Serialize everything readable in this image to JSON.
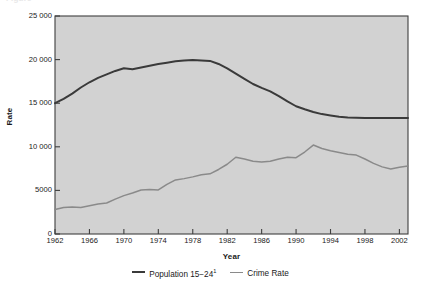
{
  "figure": {
    "clipped_title": "Figure",
    "ylabel": "Rate",
    "xlabel": "Year",
    "plot_bg": "#d2d2d2",
    "frame_color": "#3f3f3f"
  },
  "legend": {
    "position": "bottom-center",
    "entries": [
      {
        "label": "Population 15−24",
        "superscript": "1",
        "color": "#3a3a3a",
        "name": "population-15-24"
      },
      {
        "label": "Crime Rate",
        "superscript": "",
        "color": "#8a8a8a",
        "name": "crime-rate"
      }
    ]
  },
  "chart_data": {
    "type": "line",
    "title": "",
    "xlabel": "Year",
    "ylabel": "Rate",
    "xlim": [
      1962,
      2003
    ],
    "ylim": [
      0,
      25000
    ],
    "grid": false,
    "legend_position": "bottom-center",
    "xticks": [
      1962,
      1966,
      1970,
      1974,
      1978,
      1982,
      1986,
      1990,
      1994,
      1998,
      2002
    ],
    "xtick_labels": [
      "1962",
      "1966",
      "1970",
      "1974",
      "1978",
      "1982",
      "1986",
      "1990",
      "1994",
      "1998",
      "2002"
    ],
    "yticks": [
      0,
      5000,
      10000,
      15000,
      20000,
      25000
    ],
    "ytick_labels": [
      "0",
      "5000",
      "10 000",
      "15 000",
      "20 000",
      "25 000"
    ],
    "x": [
      1962,
      1963,
      1964,
      1965,
      1966,
      1967,
      1968,
      1969,
      1970,
      1971,
      1972,
      1973,
      1974,
      1975,
      1976,
      1977,
      1978,
      1979,
      1980,
      1981,
      1982,
      1983,
      1984,
      1985,
      1986,
      1987,
      1988,
      1989,
      1990,
      1991,
      1992,
      1993,
      1994,
      1995,
      1996,
      1997,
      1998,
      1999,
      2000,
      2001,
      2002,
      2003
    ],
    "series": [
      {
        "name": "Population 15−24",
        "color": "#3a3a3a",
        "linewidth": 2.0,
        "values": [
          15000,
          15500,
          16100,
          16800,
          17400,
          17900,
          18300,
          18700,
          19000,
          18900,
          19100,
          19300,
          19500,
          19650,
          19800,
          19900,
          19950,
          19900,
          19850,
          19500,
          19000,
          18400,
          17800,
          17200,
          16750,
          16350,
          15800,
          15200,
          14650,
          14300,
          14000,
          13750,
          13600,
          13450,
          13350,
          13320,
          13300,
          13300,
          13300,
          13300,
          13300,
          13300
        ]
      },
      {
        "name": "Crime Rate",
        "color": "#8a8a8a",
        "linewidth": 1.5,
        "values": [
          2800,
          3050,
          3100,
          3050,
          3250,
          3450,
          3550,
          4000,
          4400,
          4700,
          5050,
          5100,
          5050,
          5700,
          6200,
          6350,
          6550,
          6800,
          6900,
          7400,
          8000,
          8800,
          8600,
          8350,
          8250,
          8350,
          8600,
          8800,
          8750,
          9400,
          10200,
          9800,
          9550,
          9350,
          9150,
          9050,
          8600,
          8100,
          7700,
          7450,
          7650,
          7800
        ]
      }
    ]
  }
}
